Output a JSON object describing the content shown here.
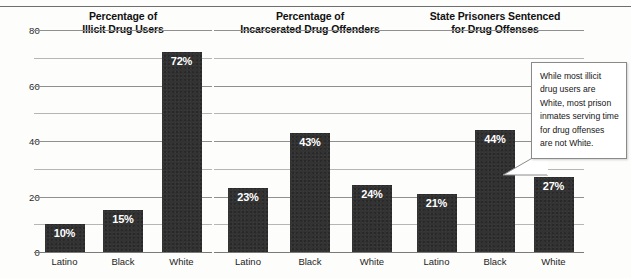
{
  "figure": {
    "panels": [
      {
        "title_line1": "Percentage of",
        "title_line2": "Illicit Drug Users",
        "categories": [
          "Latino",
          "Black",
          "White"
        ],
        "values": [
          10,
          15,
          72
        ],
        "labels": [
          "10%",
          "15%",
          "72%"
        ]
      },
      {
        "title_line1": "Percentage of",
        "title_line2": "Incarcerated Drug Offenders",
        "categories": [
          "Latino",
          "Black",
          "White"
        ],
        "values": [
          23,
          43,
          24
        ],
        "labels": [
          "23%",
          "43%",
          "24%"
        ]
      },
      {
        "title_line1": "State Prisoners Sentenced",
        "title_line2": "for Drug Offenses",
        "categories": [
          "Latino",
          "Black",
          "White"
        ],
        "values": [
          21,
          44,
          27
        ],
        "labels": [
          "21%",
          "44%",
          "27%"
        ]
      }
    ],
    "y_ticks": [
      "80",
      "60",
      "40",
      "20",
      "0"
    ],
    "callout": {
      "text": "While most illicit drug users are White, most prison inmates serving time for drug offenses are not White."
    },
    "colors": {
      "bar": "#333333",
      "gridline": "#b6b6b6",
      "value_label": "#ffffff"
    }
  },
  "chart_data": [
    {
      "type": "bar",
      "title": "Percentage of Illicit Drug Users",
      "categories": [
        "Latino",
        "Black",
        "White"
      ],
      "values": [
        10,
        15,
        72
      ],
      "xlabel": "",
      "ylabel": "",
      "ylim": [
        0,
        80
      ],
      "yticks": [
        0,
        20,
        40,
        60,
        80
      ],
      "gridline_interval": 10,
      "grid": true,
      "legend": "none",
      "data_labels": [
        "10%",
        "15%",
        "72%"
      ]
    },
    {
      "type": "bar",
      "title": "Percentage of Incarcerated Drug Offenders",
      "categories": [
        "Latino",
        "Black",
        "White"
      ],
      "values": [
        23,
        43,
        24
      ],
      "xlabel": "",
      "ylabel": "",
      "ylim": [
        0,
        80
      ],
      "yticks": [
        0,
        20,
        40,
        60,
        80
      ],
      "gridline_interval": 10,
      "grid": true,
      "legend": "none",
      "data_labels": [
        "23%",
        "43%",
        "24%"
      ]
    },
    {
      "type": "bar",
      "title": "State Prisoners Sentenced for Drug Offenses",
      "categories": [
        "Latino",
        "Black",
        "White"
      ],
      "values": [
        21,
        44,
        27
      ],
      "xlabel": "",
      "ylabel": "",
      "ylim": [
        0,
        80
      ],
      "yticks": [
        0,
        20,
        40,
        60,
        80
      ],
      "gridline_interval": 10,
      "grid": true,
      "legend": "none",
      "data_labels": [
        "21%",
        "44%",
        "27%"
      ],
      "annotations": [
        {
          "text": "While most illicit drug users are White, most prison inmates serving time for drug offenses are not White.",
          "points_to": "White"
        }
      ]
    }
  ]
}
